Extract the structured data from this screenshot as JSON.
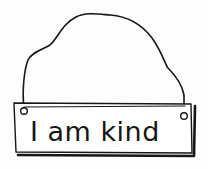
{
  "illustration": {
    "subject": "hanging sign",
    "sign_text": "I am kind",
    "colors": {
      "ink": "#161616",
      "paper": "#fdfdfd",
      "sign_fill": "#ffffff"
    },
    "icons": [
      "hanging-wire-icon",
      "grommet-hole-icon"
    ]
  }
}
